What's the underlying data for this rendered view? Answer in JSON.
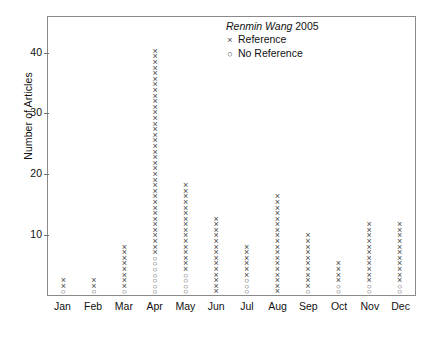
{
  "chart_data": {
    "type": "scatter",
    "title": "",
    "xlabel": "",
    "ylabel": "Number of Articles",
    "ylim": [
      0,
      46
    ],
    "yticks": [
      10,
      20,
      30,
      40
    ],
    "grid": false,
    "categories": [
      "Jan",
      "Feb",
      "Mar",
      "Apr",
      "May",
      "Jun",
      "Jul",
      "Aug",
      "Sep",
      "Oct",
      "Nov",
      "Dec"
    ],
    "values": [
      3,
      3,
      9,
      44,
      20,
      14,
      9,
      18,
      11,
      6,
      13,
      13
    ],
    "series": [
      {
        "name": "Reference",
        "marker": "x",
        "values": [
          2,
          2,
          8,
          37,
          16,
          14,
          6,
          18,
          10,
          4,
          11,
          11
        ]
      },
      {
        "name": "No Reference",
        "marker": "o",
        "values": [
          1,
          1,
          1,
          7,
          4,
          0,
          3,
          0,
          1,
          2,
          2,
          2
        ]
      }
    ],
    "legend": {
      "position": "top-right",
      "title_italic": "Renmin Wang",
      "title_year": "2005",
      "entries": [
        {
          "symbol": "×",
          "label": "Reference"
        },
        {
          "symbol": "○",
          "label": "No Reference"
        }
      ]
    },
    "markers": {
      "reference": "×",
      "no_reference": "○"
    },
    "colors": {
      "marker": "#4a4a4a",
      "frame": "#8a8a8a",
      "text": "#111111"
    }
  }
}
